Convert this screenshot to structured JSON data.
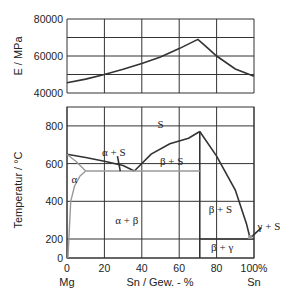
{
  "chart_data": [
    {
      "type": "line",
      "title": "",
      "xlabel": "",
      "ylabel": "E  /  MPa",
      "xlim": [
        0,
        100
      ],
      "ylim": [
        40000,
        80000
      ],
      "x_ticks": [
        0,
        20,
        40,
        60,
        80,
        100
      ],
      "y_ticks": [
        40000,
        50000,
        60000,
        70000,
        80000
      ],
      "y_tick_labels": [
        "40000",
        "",
        "60000",
        "",
        "80000"
      ],
      "grid": true,
      "series": [
        {
          "name": "Elastic modulus",
          "x": [
            0,
            10,
            20,
            30,
            40,
            50,
            60,
            70,
            75,
            80,
            90,
            100
          ],
          "y": [
            45500,
            47500,
            50000,
            52800,
            56000,
            59500,
            64000,
            69000,
            64500,
            60000,
            53000,
            49000
          ]
        }
      ]
    },
    {
      "type": "line",
      "title": "Mg-Sn phase diagram",
      "xlabel": "Sn  / Gew. - %",
      "ylabel": "Temperatur  /  °C",
      "xlim": [
        0,
        100
      ],
      "ylim": [
        0,
        900
      ],
      "x_ticks": [
        0,
        20,
        40,
        60,
        80,
        100
      ],
      "x_tick_labels": [
        "0",
        "20",
        "40",
        "60",
        "80",
        "100%"
      ],
      "x_end_labels": {
        "left": "Mg",
        "right": "Sn"
      },
      "y_ticks": [
        0,
        200,
        400,
        600,
        800
      ],
      "y_tick_labels": [
        "0",
        "200",
        "400",
        "600",
        "800"
      ],
      "grid": true,
      "series": [
        {
          "name": "liquidus-left",
          "color": "#333333",
          "x": [
            0,
            10,
            20,
            30,
            36
          ],
          "y": [
            650,
            632,
            612,
            590,
            561
          ]
        },
        {
          "name": "liquidus-middle",
          "color": "#333333",
          "x": [
            36,
            45,
            55,
            65,
            71
          ],
          "y": [
            561,
            650,
            705,
            735,
            770
          ]
        },
        {
          "name": "liquidus-right",
          "color": "#333333",
          "x": [
            71,
            80,
            90,
            96,
            98
          ],
          "y": [
            770,
            640,
            460,
            280,
            200
          ]
        },
        {
          "name": "compound-Mg2Sn",
          "color": "#333333",
          "x": [
            71,
            71
          ],
          "y": [
            0,
            770
          ]
        },
        {
          "name": "eutectic-Sn-side",
          "color": "#333333",
          "x": [
            71,
            100
          ],
          "y": [
            200,
            200
          ]
        },
        {
          "name": "solidus-alpha",
          "color": "#999999",
          "x": [
            0,
            5,
            10
          ],
          "y": [
            650,
            610,
            561
          ]
        },
        {
          "name": "eutectic-Mg-side",
          "color": "#999999",
          "x": [
            10,
            71
          ],
          "y": [
            561,
            561
          ]
        },
        {
          "name": "solvus-alpha",
          "color": "#999999",
          "x": [
            0.5,
            1,
            2,
            4,
            7,
            10
          ],
          "y": [
            0,
            200,
            400,
            480,
            535,
            561
          ]
        }
      ],
      "annotations": [
        {
          "text": "S",
          "x": 50,
          "y": 810
        },
        {
          "text": "α + S",
          "x": 25,
          "y": 660
        },
        {
          "text": "β + S",
          "x": 56,
          "y": 615
        },
        {
          "text": "α",
          "x": 4,
          "y": 520
        },
        {
          "text": "α + β",
          "x": 32,
          "y": 300
        },
        {
          "text": "β + S",
          "x": 82,
          "y": 360
        },
        {
          "text": "β + γ",
          "x": 83,
          "y": 120
        },
        {
          "text": "γ + S",
          "x": 108,
          "y": 270
        }
      ]
    }
  ]
}
